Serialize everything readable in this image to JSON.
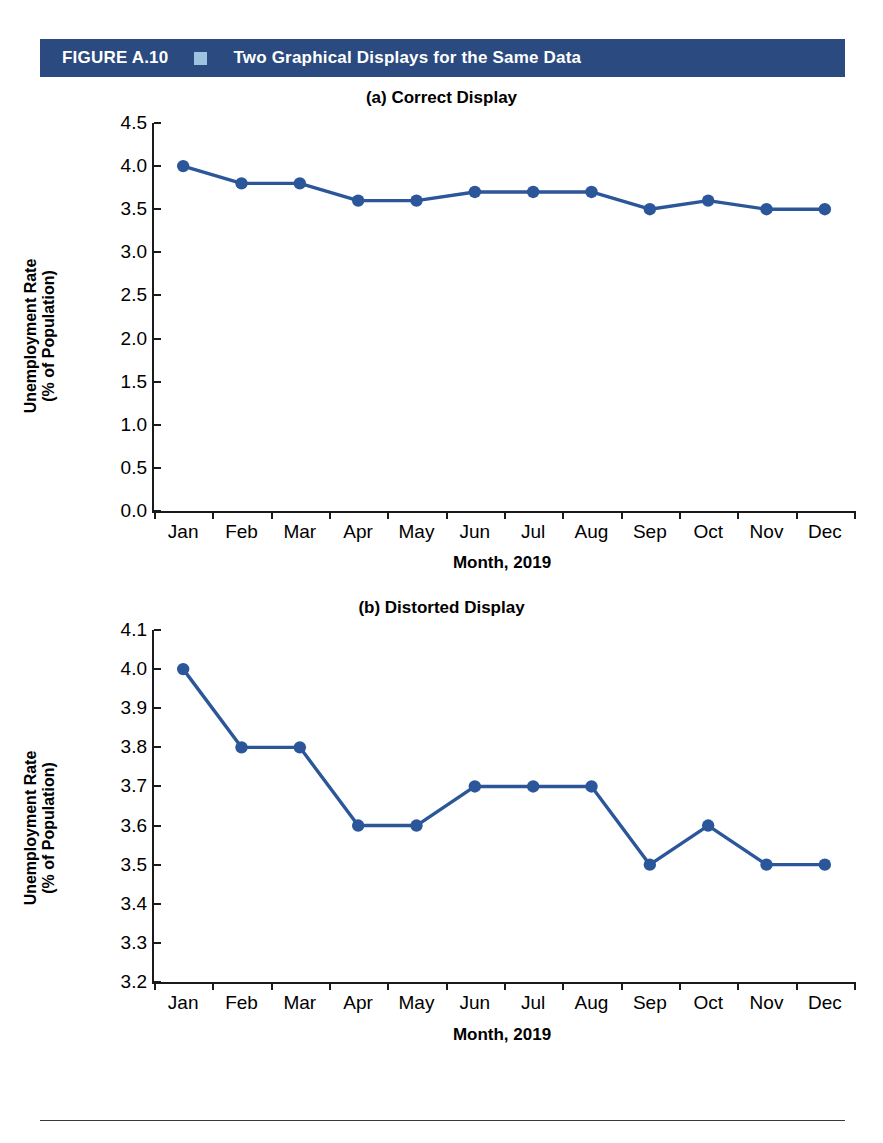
{
  "figure": {
    "number": "FIGURE A.10",
    "bullet_icon": "square-bullet-icon",
    "title": "Two Graphical Displays for the Same Data",
    "header_bg": "#2a4a80",
    "bullet_color": "#9ec3e0"
  },
  "chart_data": [
    {
      "type": "line",
      "title": "(a) Correct Display",
      "xlabel": "Month, 2019",
      "ylabel": "Unemployment Rate\n(% of Population)",
      "categories": [
        "Jan",
        "Feb",
        "Mar",
        "Apr",
        "May",
        "Jun",
        "Jul",
        "Aug",
        "Sep",
        "Oct",
        "Nov",
        "Dec"
      ],
      "values": [
        4.0,
        3.8,
        3.8,
        3.6,
        3.6,
        3.7,
        3.7,
        3.7,
        3.5,
        3.6,
        3.5,
        3.5
      ],
      "series": [
        {
          "name": "Unemployment Rate",
          "values": [
            4.0,
            3.8,
            3.8,
            3.6,
            3.6,
            3.7,
            3.7,
            3.7,
            3.5,
            3.6,
            3.5,
            3.5
          ]
        }
      ],
      "ylim": [
        0.0,
        4.5
      ],
      "ytick_step": 0.5,
      "yticks": [
        "0.0",
        "0.5",
        "1.0",
        "1.5",
        "2.0",
        "2.5",
        "3.0",
        "3.5",
        "4.0",
        "4.5"
      ],
      "grid": false,
      "legend": "none",
      "line_color": "#2b5699",
      "marker_color": "#2b5699"
    },
    {
      "type": "line",
      "title": "(b) Distorted Display",
      "xlabel": "Month, 2019",
      "ylabel": "Unemployment Rate\n(% of Population)",
      "categories": [
        "Jan",
        "Feb",
        "Mar",
        "Apr",
        "May",
        "Jun",
        "Jul",
        "Aug",
        "Sep",
        "Oct",
        "Nov",
        "Dec"
      ],
      "values": [
        4.0,
        3.8,
        3.8,
        3.6,
        3.6,
        3.7,
        3.7,
        3.7,
        3.5,
        3.6,
        3.5,
        3.5
      ],
      "series": [
        {
          "name": "Unemployment Rate",
          "values": [
            4.0,
            3.8,
            3.8,
            3.6,
            3.6,
            3.7,
            3.7,
            3.7,
            3.5,
            3.6,
            3.5,
            3.5
          ]
        }
      ],
      "ylim": [
        3.2,
        4.1
      ],
      "ytick_step": 0.1,
      "yticks": [
        "3.2",
        "3.3",
        "3.4",
        "3.5",
        "3.6",
        "3.7",
        "3.8",
        "3.9",
        "4.0",
        "4.1"
      ],
      "grid": false,
      "legend": "none",
      "line_color": "#2b5699",
      "marker_color": "#2b5699"
    }
  ]
}
